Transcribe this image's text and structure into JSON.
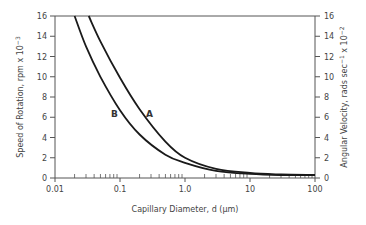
{
  "chart_data": {
    "type": "line",
    "title": "",
    "xlabel": "Capillary Diameter, d (μm)",
    "ylabel": "Speed of Rotation, rpm x 10^-3",
    "ylabel_right": "Angular Velocity, rads sec^-1 x 10^-2",
    "xscale": "log",
    "xlim": [
      0.01,
      100
    ],
    "ylim": [
      0,
      16
    ],
    "ylim_right": [
      0,
      16
    ],
    "x_ticks": [
      "0.01",
      "0.1",
      "1.0",
      "10",
      "100"
    ],
    "y_ticks": [
      "0",
      "2",
      "4",
      "6",
      "8",
      "10",
      "12",
      "14",
      "16"
    ],
    "y_ticks_right": [
      "0",
      "2",
      "4",
      "6",
      "8",
      "10",
      "12",
      "14",
      "16"
    ],
    "grid": false,
    "legend": "inline labels",
    "series": [
      {
        "name": "A",
        "x": [
          0.033,
          0.05,
          0.1,
          0.2,
          0.5,
          1.0,
          3.0,
          10,
          30,
          100
        ],
        "values": [
          16,
          13.5,
          9.9,
          6.8,
          3.6,
          2.0,
          0.9,
          0.5,
          0.35,
          0.3
        ]
      },
      {
        "name": "B",
        "x": [
          0.02,
          0.03,
          0.05,
          0.1,
          0.2,
          0.5,
          1.0,
          3.0,
          10,
          30,
          100
        ],
        "values": [
          16,
          13.0,
          10.0,
          6.7,
          4.3,
          2.3,
          1.5,
          0.7,
          0.4,
          0.3,
          0.3
        ]
      }
    ],
    "annotations": [
      {
        "text": "A",
        "near_x": 0.28,
        "near_y": 6.3
      },
      {
        "text": "B",
        "near_x": 0.085,
        "near_y": 6.3
      }
    ]
  },
  "labels": {
    "xlabel": "Capillary Diameter, d (μm)",
    "ylabel_left_main": "Speed of Rotation, rpm x 10",
    "ylabel_left_exp": "−3",
    "ylabel_right_main": "Angular Velocity, rads sec",
    "ylabel_right_exp1": "−1",
    "ylabel_right_mid": " x 10",
    "ylabel_right_exp2": "−2",
    "curve_a": "A",
    "curve_b": "B"
  },
  "colors": {
    "curve": "#1a1a1a",
    "axis": "#555555",
    "text": "#444444"
  }
}
